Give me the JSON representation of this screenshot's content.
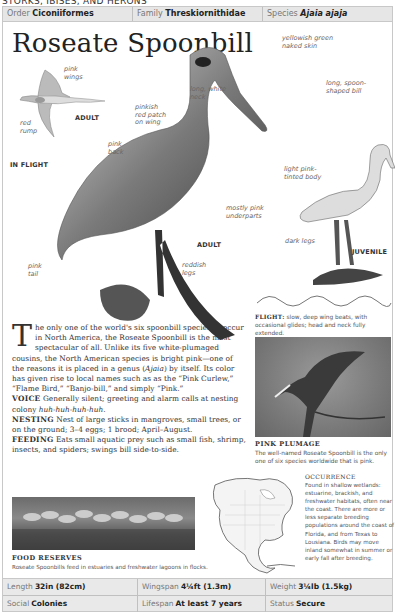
{
  "section_header": "STORKS, IBISES, AND HERONS",
  "taxonomy": {
    "order": {
      "label": "Order",
      "value": "Ciconiiformes"
    },
    "family": {
      "label": "Family",
      "value": "Threskiornithidae"
    },
    "species": {
      "label": "Species",
      "value": "Ajaia ajaja"
    }
  },
  "title": "Roseate Spoonbill",
  "illustration": {
    "labels": {
      "pink_wings": [
        "pink",
        "wings"
      ],
      "red_rump": [
        "red",
        "rump"
      ],
      "adult_flight": "ADULT",
      "in_flight": "IN FLIGHT",
      "yellowish_green": [
        "yellowish green",
        "naked skin"
      ],
      "long_white_neck": [
        "long, white",
        "neck"
      ],
      "long_spoon_bill": [
        "long, spoon-",
        "shaped bill"
      ],
      "pinkish_red_patch": [
        "pinkish",
        "red patch",
        "on wing"
      ],
      "pink_back": [
        "pink",
        "back"
      ],
      "mostly_pink": [
        "mostly pink",
        "underparts"
      ],
      "adult": "ADULT",
      "pink_tail": [
        "pink",
        "tail"
      ],
      "reddish_legs": [
        "reddish",
        "legs"
      ],
      "light_pink_body": [
        "light pink-",
        "tinted body"
      ],
      "dark_legs": "dark legs",
      "juvenile": "JUVENILE"
    }
  },
  "body": {
    "drop_cap": "T",
    "intro": "he only one of the world's six spoonbill species to occur in North America, the Roseate Spoonbill is the most spectacular of all. Unlike its five white-plumaged cousins, the North American species is bright pink—one of the reasons it is placed in a genus (",
    "genus": "Ajaia",
    "intro_end": ") by itself. Its color has given rise to local names such as as the “Pink Curlew,” “Flame Bird,” “Banjo-bill,” and simply “Pink.”",
    "voice_label": "VOICE",
    "voice": "Generally silent; greeting and alarm calls at nesting colony ",
    "voice_call": "huh-huh-huh-huh.",
    "nesting_label": "NESTING",
    "nesting": "Nest of large sticks in mangroves, small trees, or on the ground; 3–4 eggs; 1 brood; April–August.",
    "feeding_label": "FEEDING",
    "feeding": "Eats small aquatic prey such as small fish, shrimp, insects, and spiders; swings bill side-to-side."
  },
  "flight": {
    "label": "FLIGHT:",
    "text": "slow, deep wing beats, with occasional glides; head and neck fully extended."
  },
  "photo_plumage": {
    "title": "PINK PLUMAGE",
    "caption": "The well-named Roseate Spoonbill is the only one of six species worldwide that is pink."
  },
  "photo_food": {
    "title": "FOOD RESERVES",
    "caption": "Roseate Spoonbills feed in estuaries and freshwater lagoons in flocks."
  },
  "occurrence": {
    "title": "OCCURRENCE",
    "text": "Found in shallow wetlands: estuarine, brackish, and freshwater habitats, often near the coast. There are more or less separate breeding populations around the coast of Florida, and from Texas to Lousiana. Birds may move inland somewhat in summer or early fall after breeding."
  },
  "stats": {
    "length": {
      "label": "Length",
      "value": "32in (82cm)"
    },
    "wingspan": {
      "label": "Wingspan",
      "value": "4¼ft (1.3m)"
    },
    "weight": {
      "label": "Weight",
      "value": "3¼lb (1.5kg)"
    },
    "social": {
      "label": "Social",
      "value": "Colonies"
    },
    "lifespan": {
      "label": "Lifespan",
      "value": "At least 7 years"
    },
    "status": {
      "label": "Status",
      "value": "Secure"
    }
  }
}
